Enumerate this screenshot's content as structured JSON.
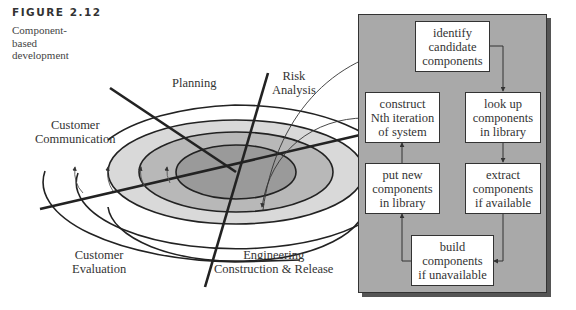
{
  "figure": {
    "label": "FIGURE 2.12",
    "caption": "Component-based development"
  },
  "spiral": {
    "quadrants": {
      "planning": [
        "Planning"
      ],
      "risk_analysis": [
        "Risk",
        "Analysis"
      ],
      "customer_communication": [
        "Customer",
        "Communication"
      ],
      "customer_evaluation": [
        "Customer",
        "Evaluation"
      ],
      "engineering": [
        "Engineering",
        "Construction & Release"
      ]
    },
    "ring_colors": [
      "#ffffff",
      "#d9d9d9",
      "#b8b8b8",
      "#9a9a9a"
    ]
  },
  "process": {
    "panel_color": "#a9a9a9",
    "boxes": {
      "identify": [
        "identify",
        "candidate",
        "components"
      ],
      "construct": [
        "construct",
        "Nth iteration",
        "of system"
      ],
      "lookup": [
        "look up",
        "components",
        "in library"
      ],
      "put_new": [
        "put new",
        "components",
        "in library"
      ],
      "extract": [
        "extract",
        "components",
        "if available"
      ],
      "build": [
        "build",
        "components",
        "if unavailable"
      ]
    }
  }
}
